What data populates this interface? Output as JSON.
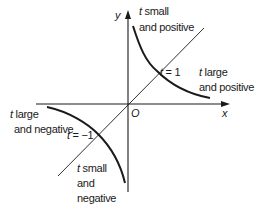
{
  "diagram": {
    "axes": {
      "x_label": "x",
      "y_label": "y",
      "origin_label": "O"
    },
    "colors": {
      "ink": "#1a1a1a",
      "background": "#ffffff"
    },
    "annotations": {
      "q1_top": {
        "var": "t",
        "line1": " small",
        "line2": "and positive"
      },
      "q1_point": {
        "var": "t",
        "text": " = 1"
      },
      "q1_right": {
        "var": "t",
        "line1": " large",
        "line2": "and positive"
      },
      "q3_left": {
        "var": "t",
        "line1": " large",
        "line2": "and negative"
      },
      "q3_point": {
        "var": "t",
        "text": " = −1"
      },
      "q3_bottom": {
        "var": "t",
        "line1": " small",
        "line2": "and",
        "line3": "negative"
      }
    }
  }
}
